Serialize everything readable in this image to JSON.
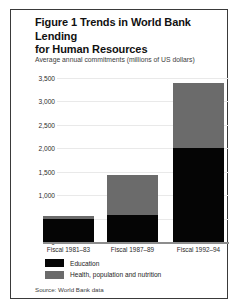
{
  "figure": {
    "title": "Figure 1 Trends in World Bank Lending for Human Resources",
    "title_line1": "Figure 1 Trends in World Bank Lending",
    "title_line2": "for Human Resources",
    "subtitle": "Average annual commitments (millions of US dollars)",
    "source": "Source: World Bank data"
  },
  "colors": {
    "education": "#050505",
    "health": "#6b6b6b",
    "frame": "#3a3a3a",
    "gridline": "#e9e9e9",
    "axis": "#8d8d8d",
    "background": "#ffffff"
  },
  "chart_data": {
    "type": "bar",
    "title": "Figure 1 Trends in World Bank Lending for Human Resources",
    "subtitle": "Average annual commitments (millions of US dollars)",
    "stacked": true,
    "xlabel": "",
    "ylabel": "Average annual commitments (millions of US dollars)",
    "ylim": [
      0,
      3500
    ],
    "yticks": [
      0,
      500,
      1000,
      1500,
      2000,
      2500,
      3000,
      3500
    ],
    "ytick_labels": [
      "0",
      "500",
      "1,000",
      "1,500",
      "2,000",
      "2,500",
      "3,000",
      "3,500"
    ],
    "grid": true,
    "legend_position": "bottom-left",
    "categories": [
      "Fiscal 1981–83",
      "Fiscal 1987–89",
      "Fiscal 1992–94"
    ],
    "series": [
      {
        "name": "Education",
        "color": "#050505",
        "values": [
          490,
          570,
          2000
        ]
      },
      {
        "name": "Health, population and nutrition",
        "color": "#6b6b6b",
        "values": [
          60,
          860,
          1400
        ]
      }
    ],
    "totals": [
      550,
      1430,
      3400
    ],
    "source": "Source: World Bank data"
  }
}
